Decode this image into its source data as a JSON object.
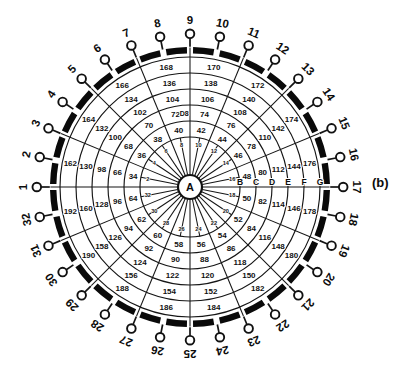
{
  "figure": {
    "label": "(b)"
  },
  "colors": {
    "ink": "#111111",
    "paper": "#ffffff"
  },
  "diagram": {
    "center_label": "A",
    "boundary_letters": [
      "B",
      "C",
      "D",
      "E",
      "F",
      "G"
    ],
    "anomaly_label": "D8",
    "terminal_labels": [
      "1",
      "2",
      "3",
      "4",
      "5",
      "6",
      "7",
      "8",
      "9",
      "10",
      "11",
      "12",
      "13",
      "14",
      "15",
      "16",
      "17",
      "18",
      "19",
      "20",
      "21",
      "22",
      "23",
      "24",
      "25",
      "26",
      "27",
      "28",
      "29",
      "30",
      "31",
      "32"
    ],
    "rings": [
      {
        "name": "ring-1-inner",
        "values": [
          2,
          4,
          6,
          8,
          10,
          12,
          14,
          16,
          18,
          20,
          22,
          24,
          26,
          28,
          30,
          32
        ]
      },
      {
        "name": "ring-2",
        "values": [
          34,
          36,
          38,
          40,
          42,
          44,
          46,
          48,
          50,
          52,
          54,
          56,
          58,
          60,
          62,
          64
        ]
      },
      {
        "name": "ring-3",
        "values": [
          66,
          68,
          70,
          72,
          74,
          76,
          78,
          80,
          82,
          84,
          86,
          88,
          90,
          92,
          94,
          96
        ]
      },
      {
        "name": "ring-4",
        "values": [
          98,
          100,
          102,
          104,
          106,
          108,
          110,
          112,
          114,
          116,
          118,
          120,
          122,
          124,
          126,
          128
        ]
      },
      {
        "name": "ring-5",
        "values": [
          130,
          132,
          134,
          136,
          138,
          140,
          142,
          144,
          146,
          148,
          150,
          152,
          154,
          156,
          158,
          160
        ]
      },
      {
        "name": "ring-6-outer",
        "values": [
          162,
          164,
          166,
          168,
          170,
          172,
          174,
          176,
          178,
          180,
          182,
          184,
          186,
          188,
          190,
          192
        ]
      }
    ]
  }
}
